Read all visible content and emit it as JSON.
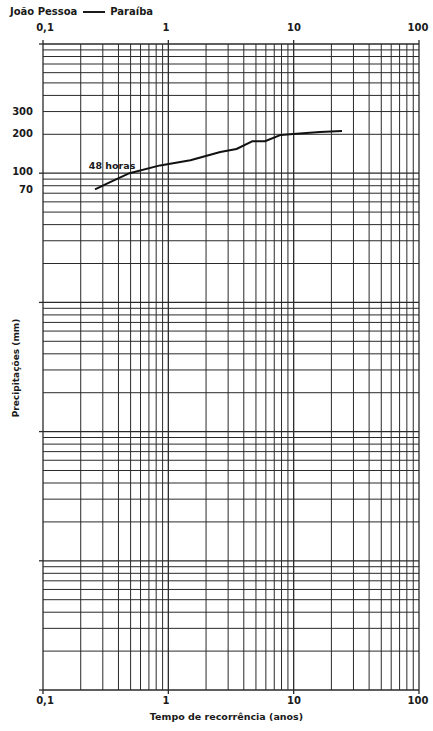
{
  "header": {
    "location_city": "João Pessoa",
    "location_state": "Paraíba"
  },
  "chart_data": {
    "type": "line",
    "xlabel": "Tempo de recorrência (anos)",
    "ylabel": "Precipitações (mm)",
    "xscale": "log",
    "yscale": "log",
    "xlim": [
      0.1,
      100
    ],
    "ylim": [
      0.01,
      1000
    ],
    "x_tick_labels": [
      "0,1",
      "1",
      "10",
      "100"
    ],
    "x_tick_values": [
      0.1,
      1,
      10,
      100
    ],
    "y_tick_labels": [
      "300",
      "200",
      "100",
      "70"
    ],
    "y_tick_values": [
      300,
      200,
      100,
      70
    ],
    "grid": true,
    "legend": null,
    "annotations": [
      {
        "text": "48 horas",
        "x": 0.3,
        "y": 110
      }
    ],
    "series": [
      {
        "name": "48 horas",
        "x": [
          0.26,
          0.34,
          0.49,
          0.86,
          1.5,
          2.6,
          3.5,
          4.7,
          5.9,
          7.9,
          9.9,
          16.2,
          24.3
        ],
        "values": [
          75,
          85,
          100,
          115,
          126,
          146,
          154,
          177,
          177,
          198,
          201,
          208,
          212
        ]
      }
    ]
  },
  "axes": {
    "top": [
      "0,1",
      "1",
      "10",
      "100"
    ],
    "bottom": [
      "0,1",
      "1",
      "10",
      "100"
    ],
    "left": [
      "300",
      "200",
      "100",
      "70"
    ]
  }
}
